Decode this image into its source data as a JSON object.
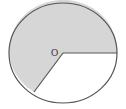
{
  "diagram": {
    "type": "circle-sector",
    "center_label": "O",
    "colors": {
      "shaded_fill": "#d6d6d6",
      "unshaded_fill": "#ffffff",
      "stroke": "#555555",
      "label": "#333333"
    },
    "geometry": {
      "center": [
        63,
        53
      ],
      "radius_x": 54,
      "radius_y": 50,
      "radius_1_end": [
        117,
        53
      ],
      "radius_2_end": [
        34,
        92
      ]
    },
    "regions": [
      {
        "name": "shaded-major-sector",
        "fill": "gray"
      },
      {
        "name": "unshaded-minor-sector",
        "fill": "white"
      }
    ]
  }
}
